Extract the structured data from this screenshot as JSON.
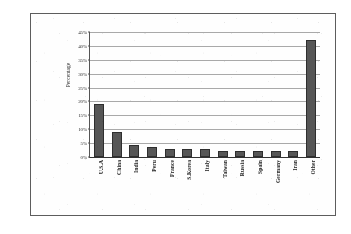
{
  "figure": {
    "y_axis_title": "Percentage"
  },
  "chart_data": {
    "type": "bar",
    "title": "",
    "subtitle": "",
    "xlabel": "",
    "ylabel": "Percentage",
    "ylim": [
      0,
      45
    ],
    "ytick_labels": [
      "45%",
      "40%",
      "35%",
      "30%",
      "25%",
      "20%",
      "15%",
      "10%",
      "5%",
      "0%"
    ],
    "ytick_values": [
      45,
      40,
      35,
      30,
      25,
      20,
      15,
      10,
      5,
      0
    ],
    "grid": true,
    "legend": false,
    "legend_position": "none",
    "bar_color": "#565656",
    "bar_edge_color": "#2e2e2e",
    "categories": [
      "U.S.A",
      "China",
      "India",
      "Peru",
      "France",
      "S.Korea",
      "Italy",
      "Taiwan",
      "Russia",
      "Spain",
      "Germany",
      "Iran",
      "Other"
    ],
    "values": [
      19,
      9,
      4.5,
      3.5,
      2.8,
      2.8,
      2.8,
      2,
      2,
      2,
      2,
      2,
      42
    ]
  }
}
